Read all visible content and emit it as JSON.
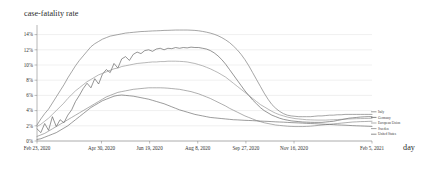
{
  "chart_data": {
    "type": "line",
    "title": "case-fatality rate",
    "xlabel": "day",
    "ylabel": "",
    "grid": true,
    "legend_position": "right-inside",
    "ylim": [
      0,
      15
    ],
    "xlim": [
      0,
      348
    ],
    "ytick_labels": [
      "14%",
      "12%",
      "10%",
      "8%",
      "6%",
      "4%",
      "2%",
      "0%"
    ],
    "ytick_values": [
      14,
      12,
      10,
      8,
      6,
      4,
      2,
      0
    ],
    "xtick_labels": [
      "Feb 23, 2020",
      "Apr 30, 2020",
      "Jun 19, 2020",
      "Aug 8, 2020",
      "Sep 27, 2020",
      "Nov 16, 2020",
      "Feb 5, 2021"
    ],
    "xtick_values": [
      0,
      67,
      117,
      167,
      217,
      267,
      348
    ],
    "x": [
      0,
      4,
      8,
      12,
      16,
      20,
      24,
      28,
      32,
      36,
      40,
      44,
      48,
      52,
      56,
      60,
      64,
      68,
      72,
      76,
      80,
      84,
      88,
      92,
      96,
      100,
      104,
      108,
      112,
      116,
      120,
      124,
      128,
      132,
      136,
      140,
      144,
      148,
      152,
      156,
      160,
      164,
      168,
      172,
      176,
      180,
      184,
      188,
      192,
      196,
      200,
      204,
      208,
      212,
      216,
      220,
      224,
      228,
      232,
      236,
      240,
      244,
      248,
      252,
      256,
      260,
      264,
      268,
      272,
      276,
      280,
      284,
      288,
      292,
      296,
      300,
      304,
      308,
      312,
      316,
      320,
      324,
      328,
      332,
      336,
      340,
      344,
      348
    ],
    "series": [
      {
        "name": "Italy",
        "color": "#6f6f6f",
        "values": [
          2.1,
          2.9,
          3.6,
          4.2,
          5.0,
          5.8,
          6.6,
          7.4,
          8.3,
          9.1,
          9.9,
          10.6,
          11.2,
          11.8,
          12.4,
          12.8,
          13.1,
          13.4,
          13.6,
          13.8,
          13.9,
          14.0,
          14.1,
          14.2,
          14.25,
          14.3,
          14.35,
          14.4,
          14.42,
          14.45,
          14.48,
          14.5,
          14.52,
          14.55,
          14.56,
          14.58,
          14.6,
          14.6,
          14.6,
          14.6,
          14.58,
          14.55,
          14.5,
          14.42,
          14.32,
          14.2,
          14.05,
          13.85,
          13.6,
          13.3,
          12.95,
          12.5,
          12.0,
          11.4,
          10.7,
          9.9,
          9.0,
          8.1,
          7.2,
          6.3,
          5.5,
          4.8,
          4.3,
          3.9,
          3.6,
          3.4,
          3.3,
          3.25,
          3.2,
          3.2,
          3.2,
          3.2,
          3.25,
          3.3,
          3.3,
          3.35,
          3.4,
          3.4,
          3.45,
          3.45,
          3.5,
          3.5,
          3.5,
          3.5,
          3.5,
          3.5,
          3.5,
          3.5
        ]
      },
      {
        "name": "Germany",
        "color": "#555555",
        "values": [
          1.6,
          1.1,
          2.3,
          1.4,
          3.2,
          1.9,
          2.8,
          2.4,
          3.4,
          4.1,
          5.2,
          6.0,
          6.9,
          7.6,
          7.0,
          8.2,
          7.5,
          8.8,
          9.4,
          9.0,
          10.2,
          9.6,
          10.8,
          11.1,
          10.6,
          11.4,
          11.7,
          11.5,
          11.9,
          12.0,
          11.8,
          12.1,
          12.2,
          12.0,
          12.2,
          12.15,
          12.3,
          12.2,
          12.3,
          12.25,
          12.35,
          12.3,
          12.3,
          12.2,
          12.1,
          11.9,
          11.6,
          11.2,
          10.7,
          10.1,
          9.4,
          8.7,
          8.0,
          7.3,
          6.6,
          6.0,
          5.4,
          4.9,
          4.4,
          4.0,
          3.7,
          3.4,
          3.2,
          3.0,
          2.85,
          2.75,
          2.65,
          2.6,
          2.55,
          2.5,
          2.48,
          2.46,
          2.45,
          2.45,
          2.45,
          2.5,
          2.55,
          2.6,
          2.7,
          2.8,
          2.9,
          3.0,
          3.05,
          3.1,
          3.15,
          3.18,
          3.2,
          3.2
        ]
      },
      {
        "name": "European Union",
        "color": "#8c8c8c",
        "values": [
          1.9,
          2.2,
          2.6,
          3.0,
          3.5,
          4.0,
          4.5,
          5.0,
          5.6,
          6.1,
          6.6,
          7.0,
          7.4,
          7.8,
          8.1,
          8.4,
          8.7,
          8.9,
          9.1,
          9.3,
          9.5,
          9.6,
          9.8,
          9.9,
          10.0,
          10.1,
          10.2,
          10.25,
          10.3,
          10.35,
          10.4,
          10.4,
          10.45,
          10.45,
          10.5,
          10.5,
          10.5,
          10.48,
          10.45,
          10.4,
          10.3,
          10.2,
          10.05,
          9.9,
          9.7,
          9.5,
          9.25,
          9.0,
          8.7,
          8.4,
          8.0,
          7.6,
          7.2,
          6.8,
          6.4,
          6.0,
          5.6,
          5.2,
          4.8,
          4.5,
          4.2,
          3.9,
          3.65,
          3.45,
          3.3,
          3.15,
          3.05,
          2.95,
          2.9,
          2.85,
          2.8,
          2.78,
          2.76,
          2.75,
          2.75,
          2.75,
          2.78,
          2.8,
          2.82,
          2.85,
          2.88,
          2.9,
          2.92,
          2.94,
          2.95,
          2.96,
          2.97,
          2.98
        ]
      },
      {
        "name": "Sweden",
        "color": "#7d7d7d",
        "values": [
          0.6,
          0.8,
          1.0,
          1.3,
          1.6,
          1.9,
          2.2,
          2.5,
          2.8,
          3.1,
          3.4,
          3.7,
          4.0,
          4.3,
          4.6,
          4.9,
          5.2,
          5.5,
          5.8,
          6.0,
          6.2,
          6.4,
          6.5,
          6.6,
          6.7,
          6.8,
          6.85,
          6.9,
          6.95,
          7.0,
          7.0,
          7.0,
          7.0,
          6.98,
          6.95,
          6.9,
          6.85,
          6.8,
          6.7,
          6.6,
          6.5,
          6.35,
          6.2,
          6.0,
          5.8,
          5.6,
          5.35,
          5.1,
          4.85,
          4.6,
          4.3,
          4.05,
          3.8,
          3.55,
          3.3,
          3.1,
          2.9,
          2.7,
          2.55,
          2.4,
          2.3,
          2.2,
          2.1,
          2.05,
          2.0,
          1.95,
          1.92,
          1.9,
          1.9,
          1.9,
          1.92,
          1.95,
          2.0,
          2.05,
          2.1,
          2.15,
          2.2,
          2.25,
          2.3,
          2.35,
          2.4,
          2.45,
          2.5,
          2.52,
          2.55,
          2.56,
          2.58,
          2.6
        ]
      },
      {
        "name": "United States",
        "color": "#5f5f5f",
        "values": [
          0.2,
          0.3,
          0.5,
          0.7,
          0.9,
          1.1,
          1.4,
          1.7,
          2.0,
          2.4,
          2.8,
          3.2,
          3.6,
          4.0,
          4.4,
          4.7,
          5.0,
          5.3,
          5.5,
          5.7,
          5.9,
          6.0,
          6.05,
          6.0,
          5.95,
          5.9,
          5.8,
          5.7,
          5.6,
          5.5,
          5.35,
          5.2,
          5.05,
          4.9,
          4.7,
          4.5,
          4.3,
          4.1,
          3.95,
          3.8,
          3.65,
          3.5,
          3.4,
          3.3,
          3.2,
          3.1,
          3.05,
          3.0,
          2.95,
          2.9,
          2.85,
          2.8,
          2.78,
          2.75,
          2.72,
          2.7,
          2.68,
          2.65,
          2.62,
          2.6,
          2.58,
          2.55,
          2.52,
          2.5,
          2.48,
          2.45,
          2.42,
          2.4,
          2.38,
          2.35,
          2.32,
          2.3,
          2.28,
          2.25,
          2.22,
          2.2,
          2.18,
          2.15,
          2.12,
          2.1,
          2.08,
          2.05,
          2.02,
          2.0,
          1.98,
          1.96,
          1.94,
          1.92
        ]
      }
    ]
  }
}
